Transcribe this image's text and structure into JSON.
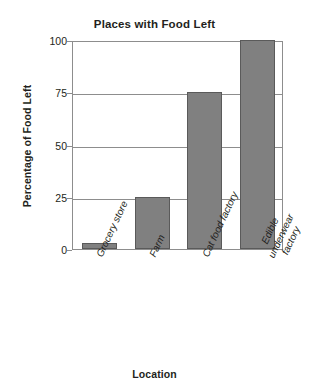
{
  "chart_data": {
    "type": "bar",
    "title": "Places with Food Left",
    "xlabel": "Location",
    "ylabel": "Percentage of Food Left",
    "categories": [
      "Grocery store",
      "Farm",
      "Cat food factory",
      "Edible underwear factory"
    ],
    "values": [
      3,
      25,
      75,
      100
    ],
    "ylim": [
      0,
      100
    ],
    "yticks": [
      0,
      25,
      50,
      75,
      100
    ],
    "ytick_labels": [
      "0",
      "25",
      "50",
      "75",
      "100"
    ],
    "grid": "horizontal",
    "legend": "none",
    "bar_color": "#808080",
    "bar_edge_color": "#5a5a5a",
    "axis_color": "#8d8d8d",
    "text_color": "#231f20"
  },
  "axis": {
    "y": {
      "title": "Percentage of Food Left",
      "ticks": [
        {
          "value": 100,
          "label": "100"
        },
        {
          "value": 75,
          "label": "75"
        },
        {
          "value": 50,
          "label": "50"
        },
        {
          "value": 25,
          "label": "25"
        },
        {
          "value": 0,
          "label": "0"
        }
      ]
    },
    "x": {
      "title": "Location",
      "ticks": [
        {
          "label": "Grocery store"
        },
        {
          "label": "Farm"
        },
        {
          "label": "Cat food factory"
        },
        {
          "label": "Edible underwear\nfactory"
        }
      ]
    }
  }
}
